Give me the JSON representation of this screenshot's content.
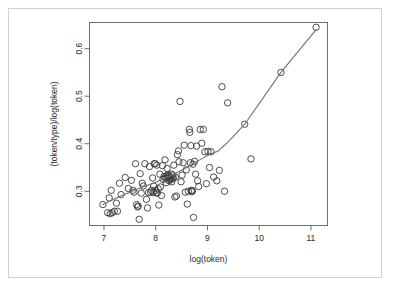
{
  "figure": {
    "background_color": "#ffffff",
    "frame_color": "#d0d0d0",
    "axis_color": "#6e6e6e",
    "point_color": "#3a3a3a",
    "curve_color": "#707070"
  },
  "chart_data": {
    "type": "scatter",
    "title": "",
    "subtitle": "",
    "xlabel": "log(token)",
    "ylabel": "(token/type)/log(token)",
    "xlim": [
      6.72,
      11.32
    ],
    "ylim": [
      0.228,
      0.655
    ],
    "xticks": [
      7,
      8,
      9,
      10,
      11
    ],
    "xtick_labels": [
      "7",
      "8",
      "9",
      "10",
      "11"
    ],
    "yticks": [
      0.3,
      0.4,
      0.5,
      0.6
    ],
    "ytick_labels": [
      "0.3",
      "0.4",
      "0.5",
      "0.6"
    ],
    "grid": false,
    "legend": null,
    "legend_position": "none",
    "annotations": [],
    "series": [
      {
        "name": "observations",
        "marker": "open-circle",
        "marker_size": 3.2,
        "x": [
          6.98,
          7.07,
          7.1,
          7.12,
          7.14,
          7.16,
          7.2,
          7.24,
          7.26,
          7.3,
          7.33,
          7.41,
          7.47,
          7.53,
          7.56,
          7.58,
          7.61,
          7.63,
          7.65,
          7.66,
          7.68,
          7.7,
          7.72,
          7.74,
          7.76,
          7.79,
          7.82,
          7.84,
          7.86,
          7.88,
          7.9,
          7.92,
          7.94,
          7.95,
          7.96,
          7.97,
          7.99,
          8.0,
          8.01,
          8.02,
          8.03,
          8.05,
          8.06,
          8.08,
          8.09,
          8.11,
          8.13,
          8.14,
          8.16,
          8.18,
          8.19,
          8.2,
          8.21,
          8.22,
          8.23,
          8.24,
          8.25,
          8.26,
          8.27,
          8.28,
          8.29,
          8.3,
          8.31,
          8.32,
          8.33,
          8.34,
          8.35,
          8.37,
          8.38,
          8.4,
          8.42,
          8.44,
          8.45,
          8.47,
          8.49,
          8.51,
          8.53,
          8.55,
          8.57,
          8.59,
          8.61,
          8.63,
          8.65,
          8.66,
          8.67,
          8.68,
          8.69,
          8.7,
          8.71,
          8.72,
          8.73,
          8.75,
          8.77,
          8.79,
          8.81,
          8.83,
          8.86,
          8.89,
          8.92,
          8.95,
          8.98,
          9.01,
          9.04,
          9.07,
          9.12,
          9.18,
          9.23,
          9.28,
          9.33,
          9.39,
          9.72,
          9.84,
          10.42,
          11.1
        ],
        "y": [
          0.272,
          0.255,
          0.286,
          0.253,
          0.302,
          0.255,
          0.258,
          0.275,
          0.258,
          0.317,
          0.293,
          0.329,
          0.306,
          0.323,
          0.302,
          0.298,
          0.358,
          0.272,
          0.267,
          0.269,
          0.241,
          0.337,
          0.296,
          0.317,
          0.311,
          0.358,
          0.283,
          0.265,
          0.297,
          0.352,
          0.298,
          0.302,
          0.328,
          0.297,
          0.311,
          0.358,
          0.358,
          0.302,
          0.297,
          0.355,
          0.296,
          0.305,
          0.271,
          0.336,
          0.309,
          0.291,
          0.354,
          0.325,
          0.331,
          0.366,
          0.327,
          0.318,
          0.333,
          0.348,
          0.33,
          0.335,
          0.332,
          0.322,
          0.325,
          0.33,
          0.327,
          0.336,
          0.32,
          0.326,
          0.334,
          0.328,
          0.355,
          0.288,
          0.33,
          0.29,
          0.377,
          0.385,
          0.362,
          0.489,
          0.32,
          0.334,
          0.36,
          0.397,
          0.298,
          0.345,
          0.273,
          0.3,
          0.43,
          0.424,
          0.36,
          0.396,
          0.302,
          0.299,
          0.301,
          0.357,
          0.245,
          0.363,
          0.336,
          0.395,
          0.322,
          0.31,
          0.43,
          0.401,
          0.43,
          0.383,
          0.316,
          0.384,
          0.35,
          0.383,
          0.33,
          0.322,
          0.344,
          0.52,
          0.3,
          0.486,
          0.441,
          0.368,
          0.55,
          0.645
        ]
      }
    ],
    "fit_curve": {
      "name": "lowess-smoother",
      "style": "solid",
      "x": [
        6.98,
        7.3,
        7.7,
        8.0,
        8.3,
        8.6,
        8.85,
        9.05,
        9.2,
        9.4,
        9.72,
        10.42,
        11.1
      ],
      "y": [
        0.272,
        0.289,
        0.307,
        0.319,
        0.333,
        0.35,
        0.366,
        0.378,
        0.384,
        0.404,
        0.441,
        0.55,
        0.64
      ]
    }
  }
}
